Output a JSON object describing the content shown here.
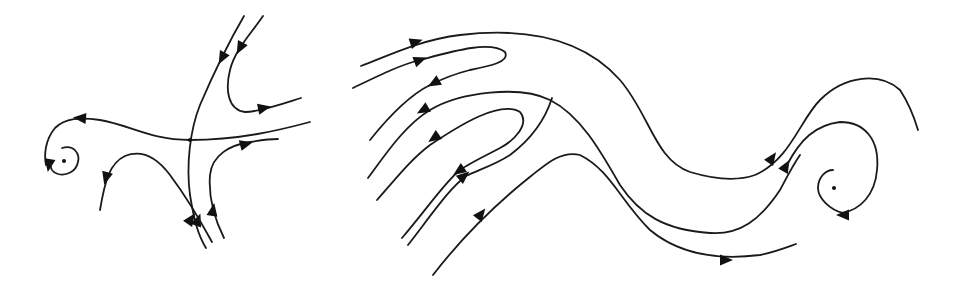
{
  "figure": {
    "panels": [
      {
        "id": "left",
        "features": [
          "saddle-point",
          "spiral-focus"
        ],
        "colors": {
          "line": "#1a1a1a",
          "arrow": "#111111",
          "background": "#ffffff"
        }
      },
      {
        "id": "right",
        "features": [
          "folded-streamlines",
          "meander",
          "spiral-vortex"
        ],
        "colors": {
          "line": "#1a1a1a",
          "arrow": "#111111",
          "background": "#ffffff"
        }
      }
    ]
  }
}
